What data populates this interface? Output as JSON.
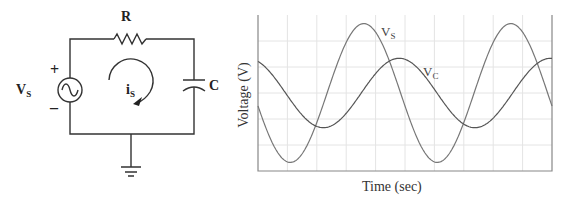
{
  "circuit": {
    "resistor_label": "R",
    "capacitor_label": "C",
    "source_label": "V",
    "source_label_sub": "S",
    "plus_sign": "+",
    "minus_sign": "–",
    "current_label": "i",
    "current_label_sub": "S",
    "components": [
      "ac-voltage-source",
      "resistor",
      "capacitor",
      "ground"
    ],
    "current_direction": "clockwise"
  },
  "chart_data": {
    "type": "line",
    "title": "",
    "xlabel": "Time (sec)",
    "ylabel": "Voltage (V)",
    "grid": true,
    "grid_divisions_x": 10,
    "grid_divisions_y": 6,
    "tick_labels": false,
    "series": [
      {
        "name": "Vs",
        "label_main": "V",
        "label_sub": "S",
        "amplitude": 1.0,
        "offset": 0.0,
        "period_divisions": 5.0,
        "phase_peak_division": 3.6,
        "start_value": 0.0,
        "color": "#777777"
      },
      {
        "name": "Vc",
        "label_main": "V",
        "label_sub": "C",
        "amplitude": 0.5,
        "offset": 0.0,
        "period_divisions": 5.15,
        "phase_peak_division": 4.8,
        "start_value": 0.5,
        "color": "#555555"
      }
    ]
  }
}
